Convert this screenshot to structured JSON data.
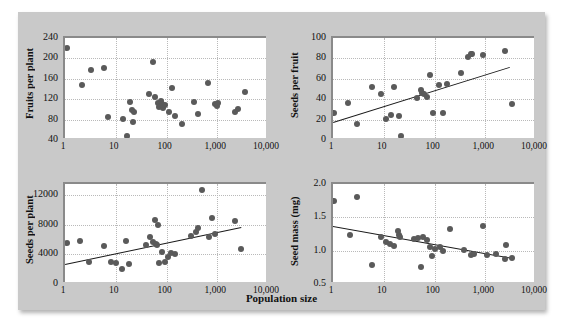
{
  "figure": {
    "xaxis_title": "Population size",
    "background_color": "#c9c9c9",
    "plot_background_color": "#ffffff",
    "point_color": "#5a5a5a",
    "trendline_color": "#1a1a1a",
    "gridline_color": "#b9b9b9"
  },
  "chart_data": [
    {
      "type": "scatter",
      "panel": "top-left",
      "title": "",
      "xlabel": "Population size",
      "ylabel": "Fruits per plant",
      "xscale": "log",
      "xlim": [
        1,
        10000
      ],
      "ylim": [
        40,
        240
      ],
      "xticks": [
        "1",
        "10",
        "100",
        "1,000",
        "10,000"
      ],
      "xtick_values": [
        1,
        10,
        100,
        1000,
        10000
      ],
      "yticks": [
        "40",
        "80",
        "120",
        "160",
        "200",
        "240"
      ],
      "ytick_values": [
        40,
        80,
        120,
        160,
        200,
        240
      ],
      "grid": true,
      "trendline": null,
      "points": [
        [
          1.1,
          220
        ],
        [
          2.2,
          148
        ],
        [
          3.2,
          178
        ],
        [
          6.0,
          181
        ],
        [
          7.0,
          85
        ],
        [
          14.0,
          82
        ],
        [
          17.0,
          48
        ],
        [
          19.0,
          115
        ],
        [
          21.0,
          99
        ],
        [
          22.0,
          76
        ],
        [
          23.0,
          94
        ],
        [
          45.0,
          131
        ],
        [
          55.0,
          193
        ],
        [
          60.0,
          124
        ],
        [
          68.0,
          112
        ],
        [
          72.0,
          104
        ],
        [
          78.0,
          117
        ],
        [
          80.0,
          110
        ],
        [
          85.0,
          103
        ],
        [
          95.0,
          108
        ],
        [
          110.0,
          95
        ],
        [
          130.0,
          141
        ],
        [
          150.0,
          87
        ],
        [
          200.0,
          72
        ],
        [
          350.0,
          115
        ],
        [
          420.0,
          91
        ],
        [
          650.0,
          152
        ],
        [
          900.0,
          111
        ],
        [
          1000.0,
          106
        ],
        [
          1050.0,
          113
        ],
        [
          2200.0,
          95
        ],
        [
          2600.0,
          101
        ],
        [
          3600.0,
          134
        ]
      ]
    },
    {
      "type": "scatter",
      "panel": "top-right",
      "title": "",
      "xlabel": "Population size",
      "ylabel": "Seeds per fruit",
      "xscale": "log",
      "xlim": [
        1,
        10000
      ],
      "ylim": [
        0,
        100
      ],
      "xticks": [
        "1",
        "10",
        "100",
        "1,000",
        "10,000"
      ],
      "xtick_values": [
        1,
        10,
        100,
        1000,
        10000
      ],
      "yticks": [
        "0",
        "20",
        "40",
        "60",
        "80",
        "100"
      ],
      "ytick_values": [
        0,
        20,
        40,
        60,
        80,
        100
      ],
      "grid": true,
      "trendline": {
        "x1": 1,
        "y1": 18,
        "x2": 3000,
        "y2": 72
      },
      "points": [
        [
          1.05,
          26
        ],
        [
          2.0,
          36
        ],
        [
          3.0,
          16
        ],
        [
          6.0,
          52
        ],
        [
          9.0,
          45
        ],
        [
          11.0,
          21
        ],
        [
          14.0,
          25
        ],
        [
          16.0,
          52
        ],
        [
          20.0,
          24
        ],
        [
          22.0,
          4
        ],
        [
          45.0,
          41
        ],
        [
          55.0,
          49
        ],
        [
          58.0,
          46
        ],
        [
          62.0,
          45
        ],
        [
          70.0,
          42
        ],
        [
          80.0,
          64
        ],
        [
          95.0,
          26
        ],
        [
          120.0,
          54
        ],
        [
          150.0,
          26
        ],
        [
          180.0,
          55
        ],
        [
          330.0,
          66
        ],
        [
          450.0,
          81
        ],
        [
          520.0,
          84
        ],
        [
          560.0,
          84
        ],
        [
          900.0,
          83
        ],
        [
          2400.0,
          87
        ],
        [
          3300.0,
          35
        ]
      ]
    },
    {
      "type": "scatter",
      "panel": "bottom-left",
      "title": "",
      "xlabel": "Population size",
      "ylabel": "Seeds per plant",
      "xscale": "log",
      "xlim": [
        1,
        10000
      ],
      "ylim": [
        0,
        13500
      ],
      "xticks": [
        "1",
        "10",
        "100",
        "1,000",
        "10,000"
      ],
      "xtick_values": [
        1,
        10,
        100,
        1000,
        10000
      ],
      "yticks": [
        "0",
        "4000",
        "8000",
        "12000"
      ],
      "ytick_values": [
        0,
        4000,
        8000,
        12000
      ],
      "grid": true,
      "trendline": {
        "x1": 1,
        "y1": 2700,
        "x2": 3000,
        "y2": 7700
      },
      "points": [
        [
          1.1,
          5500
        ],
        [
          2.0,
          5750
        ],
        [
          3.0,
          2950
        ],
        [
          6.0,
          5100
        ],
        [
          8.0,
          2950
        ],
        [
          10.0,
          2900
        ],
        [
          13.0,
          2000
        ],
        [
          16.0,
          5800
        ],
        [
          18.0,
          2700
        ],
        [
          40.0,
          5300
        ],
        [
          48.0,
          6300
        ],
        [
          55.0,
          5700
        ],
        [
          60.0,
          8700
        ],
        [
          62.0,
          5400
        ],
        [
          65.0,
          5250
        ],
        [
          68.0,
          7950
        ],
        [
          72.0,
          2900
        ],
        [
          80.0,
          4350
        ],
        [
          95.0,
          3000
        ],
        [
          105.0,
          3600
        ],
        [
          120.0,
          4200
        ],
        [
          150.0,
          4000
        ],
        [
          300.0,
          6450
        ],
        [
          380.0,
          7000
        ],
        [
          420.0,
          7550
        ],
        [
          500.0,
          12750
        ],
        [
          700.0,
          6350
        ],
        [
          800.0,
          8950
        ],
        [
          900.0,
          6800
        ],
        [
          2200.0,
          8550
        ],
        [
          3000.0,
          4750
        ]
      ]
    },
    {
      "type": "scatter",
      "panel": "bottom-right",
      "title": "",
      "xlabel": "Population size",
      "ylabel": "Seed mass (mg)",
      "xscale": "log",
      "xlim": [
        1,
        10000
      ],
      "ylim": [
        0.5,
        2.0
      ],
      "xticks": [
        "1",
        "10",
        "100",
        "1,000",
        "10,000"
      ],
      "xtick_values": [
        1,
        10,
        100,
        1000,
        10000
      ],
      "yticks": [
        "0.5",
        "1.0",
        "1.5",
        "2.0"
      ],
      "ytick_values": [
        0.5,
        1.0,
        1.5,
        2.0
      ],
      "grid": true,
      "trendline": {
        "x1": 1,
        "y1": 1.37,
        "x2": 3400,
        "y2": 0.89
      },
      "points": [
        [
          1.05,
          1.74
        ],
        [
          2.2,
          1.23
        ],
        [
          3.0,
          1.8
        ],
        [
          6.0,
          0.79
        ],
        [
          9.0,
          1.2
        ],
        [
          11.0,
          1.13
        ],
        [
          13.0,
          1.1
        ],
        [
          16.0,
          1.07
        ],
        [
          19.0,
          1.3
        ],
        [
          20.0,
          1.23
        ],
        [
          21.0,
          1.2
        ],
        [
          40.0,
          1.17
        ],
        [
          48.0,
          1.19
        ],
        [
          55.0,
          0.75
        ],
        [
          60.0,
          1.21
        ],
        [
          70.0,
          1.16
        ],
        [
          80.0,
          1.05
        ],
        [
          90.0,
          0.92
        ],
        [
          100.0,
          1.02
        ],
        [
          130.0,
          1.06
        ],
        [
          150.0,
          0.99
        ],
        [
          200.0,
          1.32
        ],
        [
          380.0,
          1.01
        ],
        [
          520.0,
          0.93
        ],
        [
          600.0,
          0.95
        ],
        [
          900.0,
          1.37
        ],
        [
          1100.0,
          0.94
        ],
        [
          1600.0,
          0.95
        ],
        [
          2400.0,
          0.88
        ],
        [
          2600.0,
          1.08
        ],
        [
          3400.0,
          0.89
        ]
      ]
    }
  ]
}
